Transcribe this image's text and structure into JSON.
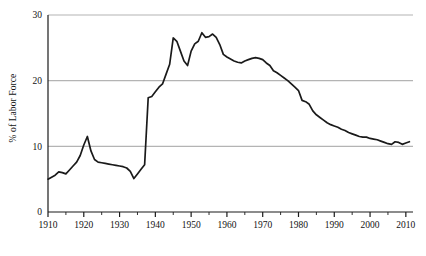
{
  "chart_data": {
    "type": "line",
    "title": "",
    "subtitle": "",
    "xlabel": "",
    "ylabel": "% of Labor Force",
    "xlim": [
      1910,
      2012
    ],
    "ylim": [
      0,
      30
    ],
    "xticks": [
      1910,
      1920,
      1930,
      1940,
      1950,
      1960,
      1970,
      1980,
      1990,
      2000,
      2010
    ],
    "xtick_labels": [
      "1910",
      "1920",
      "1930",
      "1940",
      "1950",
      "1960",
      "1970",
      "1980",
      "1990",
      "2000",
      "2010"
    ],
    "minor_xtick_interval": 5,
    "yticks": [
      0,
      10,
      20,
      30
    ],
    "ytick_labels": [
      "0",
      "10",
      "20",
      "30"
    ],
    "grid": "horizontal",
    "grid_color": "#b4b4b4",
    "line_color": "#1a1a1a",
    "line_width": 1.7,
    "legend": "none",
    "annotations": [],
    "series": [
      {
        "name": "Union membership",
        "x": [
          1910,
          1911,
          1912,
          1913,
          1914,
          1915,
          1916,
          1917,
          1918,
          1919,
          1920,
          1921,
          1922,
          1923,
          1924,
          1925,
          1926,
          1927,
          1928,
          1929,
          1930,
          1931,
          1932,
          1933,
          1934,
          1935,
          1936,
          1937,
          1938,
          1939,
          1940,
          1941,
          1942,
          1943,
          1944,
          1945,
          1946,
          1947,
          1948,
          1949,
          1950,
          1951,
          1952,
          1953,
          1954,
          1955,
          1956,
          1957,
          1958,
          1959,
          1960,
          1961,
          1962,
          1963,
          1964,
          1965,
          1966,
          1967,
          1968,
          1969,
          1970,
          1971,
          1972,
          1973,
          1974,
          1975,
          1976,
          1977,
          1978,
          1979,
          1980,
          1981,
          1982,
          1983,
          1984,
          1985,
          1986,
          1987,
          1988,
          1989,
          1990,
          1991,
          1992,
          1993,
          1994,
          1995,
          1996,
          1997,
          1998,
          1999,
          2000,
          2001,
          2002,
          2003,
          2004,
          2005,
          2006,
          2007,
          2008,
          2009,
          2010,
          2011
        ],
        "values": [
          5.0,
          5.3,
          5.6,
          6.1,
          6.0,
          5.8,
          6.4,
          7.0,
          7.6,
          8.6,
          10.2,
          11.5,
          9.3,
          8.0,
          7.6,
          7.5,
          7.4,
          7.3,
          7.2,
          7.1,
          7.0,
          6.9,
          6.7,
          6.2,
          5.1,
          5.8,
          6.5,
          7.2,
          17.4,
          17.6,
          18.3,
          19.0,
          19.5,
          21.0,
          22.5,
          26.5,
          26.0,
          24.5,
          23.0,
          22.3,
          24.5,
          25.6,
          26.0,
          27.3,
          26.6,
          26.7,
          27.1,
          26.6,
          25.5,
          24.0,
          23.6,
          23.3,
          23.0,
          22.8,
          22.7,
          23.0,
          23.2,
          23.4,
          23.5,
          23.4,
          23.2,
          22.7,
          22.3,
          21.5,
          21.2,
          20.8,
          20.4,
          20.0,
          19.5,
          19.0,
          18.5,
          17.0,
          16.8,
          16.4,
          15.4,
          14.8,
          14.4,
          14.0,
          13.6,
          13.3,
          13.1,
          12.9,
          12.6,
          12.4,
          12.1,
          11.9,
          11.7,
          11.5,
          11.4,
          11.4,
          11.2,
          11.1,
          11.0,
          10.8,
          10.6,
          10.4,
          10.3,
          10.7,
          10.6,
          10.3,
          10.5,
          10.7
        ]
      }
    ]
  },
  "axes": {
    "y_axis_label": "% of Labor Force"
  }
}
